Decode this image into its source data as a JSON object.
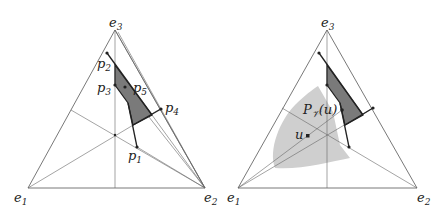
{
  "left_panel": {
    "vertices": {
      "e1": "e",
      "e1_sub": "1",
      "e2": "e",
      "e2_sub": "2",
      "e3": "e",
      "e3_sub": "3"
    },
    "points": {
      "p1": "p",
      "p1_sub": "1",
      "p2": "p",
      "p2_sub": "2",
      "p3": "p",
      "p3_sub": "3",
      "p4": "p",
      "p4_sub": "4",
      "p5": "p",
      "p5_sub": "5"
    }
  },
  "right_panel": {
    "vertices": {
      "e1": "e",
      "e1_sub": "1",
      "e2": "e",
      "e2_sub": "2",
      "e3": "e",
      "e3_sub": "3"
    },
    "projection_label": "P",
    "projection_sub": "𝒱",
    "projection_arg": "(u)",
    "point_u": "u"
  },
  "colors": {
    "line": "#555555",
    "thick": "#222222",
    "dark_fill": "#7a7a7a",
    "light_fill": "#cfcfcf"
  }
}
